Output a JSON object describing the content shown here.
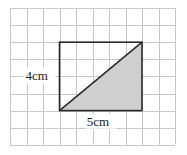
{
  "diagram": {
    "type": "geometry-grid",
    "grid": {
      "columns": 10,
      "rows": 8,
      "origin_x": 10,
      "origin_y": 8,
      "cell_w": 16.5,
      "cell_h": 17.1,
      "line_color": "#c8c8c8"
    },
    "rectangle": {
      "col": 3,
      "row": 2,
      "width_cells": 5,
      "height_cells": 4,
      "stroke_color": "#2b2b2b"
    },
    "shaded_triangle": {
      "description": "lower-right half of rectangle, cut by diagonal from bottom-left to top-right",
      "fill_color": "#cfcfcf"
    },
    "labels": {
      "height": "4cm",
      "width": "5cm"
    }
  }
}
